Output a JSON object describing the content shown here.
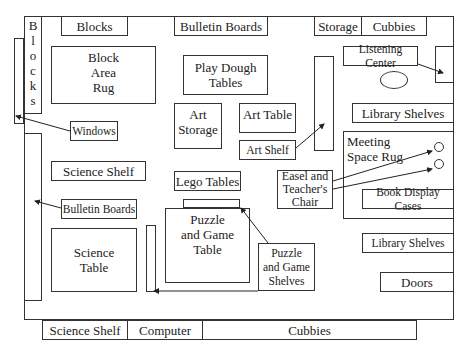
{
  "areas": {
    "blocks_side": "B\nl\no\nc\nk\ns",
    "blocks_top": "Blocks",
    "block_area_rug": "Block\nArea\nRug",
    "bulletin_boards_top": "Bulletin Boards",
    "storage": "Storage",
    "cubbies_top": "Cubbies",
    "listening_center": "Listening Center",
    "play_dough_tables": "Play Dough\nTables",
    "art_storage": "Art\nStorage",
    "art_table": "Art Table",
    "art_shelf": "Art Shelf",
    "library_shelves_upper": "Library Shelves",
    "windows": "Windows",
    "meeting_space_rug": "Meeting\nSpace Rug",
    "science_shelf_left": "Science Shelf",
    "lego_tables": "Lego Tables",
    "easel_and_teachers_chair": "Easel and\nTeacher's\nChair",
    "book_display_cases": "Book Display Cases",
    "bulletin_boards_left": "Bulletin Boards",
    "science_table": "Science\nTable",
    "puzzle_and_game_table": "Puzzle\nand Game\nTable",
    "puzzle_and_game_shelves": "Puzzle\nand Game\nShelves",
    "library_shelves_lower": "Library Shelves",
    "doors": "Doors",
    "science_shelf_bottom": "Science Shelf",
    "computer": "Computer",
    "cubbies_bottom": "Cubbies"
  },
  "colors": {
    "line": "#333333",
    "background": "#ffffff"
  }
}
